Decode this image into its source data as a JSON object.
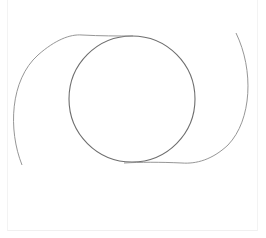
{
  "drawing": {
    "background": "#ffffff",
    "frame_color": "#f0f0f0",
    "shapes": [
      {
        "name": "circle",
        "type": "circle",
        "cx": 132,
        "cy": 99,
        "r": 63,
        "stroke": "#6e6e6e",
        "stroke_width": 1.1
      },
      {
        "name": "left-arc",
        "type": "path",
        "d": "M 22 165 C 8 130, 10 80, 38 55 C 55 40, 70 34, 82 35 C 100 36, 118 36, 133 36",
        "stroke": "#8a8a8a",
        "stroke_width": 0.9
      },
      {
        "name": "right-arc",
        "type": "path",
        "d": "M 236 33 C 254 70, 252 120, 228 145 C 212 160, 196 164, 182 163 C 160 162, 140 162, 124 163",
        "stroke": "#8a8a8a",
        "stroke_width": 0.9
      }
    ]
  }
}
